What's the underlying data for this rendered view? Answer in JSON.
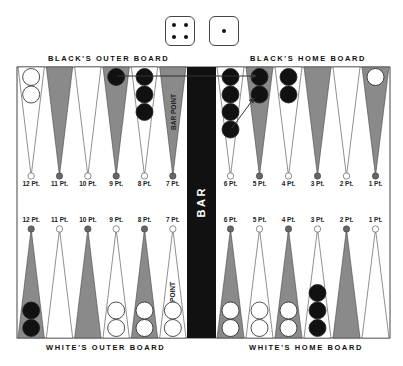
{
  "dice": [
    {
      "name": "die-four",
      "value": 4
    },
    {
      "name": "die-one",
      "value": 1
    }
  ],
  "labels": {
    "black_outer": "BLACK'S OUTER BOARD",
    "black_home": "BLACK'S HOME BOARD",
    "white_outer": "WHITE'S OUTER BOARD",
    "white_home": "WHITE'S HOME BOARD",
    "bar": "B A R",
    "bar_point_top": "BAR POINT",
    "bar_point_bottom": "POINT"
  },
  "top_points": [
    {
      "label": "12 Pt.",
      "shade": "white",
      "checkers": {
        "color": "white",
        "count": 2
      }
    },
    {
      "label": "11 Pt.",
      "shade": "dark",
      "checkers": {
        "color": "none",
        "count": 0
      }
    },
    {
      "label": "10 Pt.",
      "shade": "white",
      "checkers": {
        "color": "none",
        "count": 0
      }
    },
    {
      "label": "9 Pt.",
      "shade": "dark",
      "checkers": {
        "color": "black",
        "count": 1
      }
    },
    {
      "label": "8 Pt.",
      "shade": "white",
      "checkers": {
        "color": "black",
        "count": 3
      }
    },
    {
      "label": "7 Pt.",
      "shade": "dark",
      "checkers": {
        "color": "none",
        "count": 0
      }
    },
    {
      "label": "6 Pt.",
      "shade": "white",
      "checkers": {
        "color": "black",
        "count": 4
      }
    },
    {
      "label": "5 Pt.",
      "shade": "dark",
      "checkers": {
        "color": "black",
        "count": 2
      }
    },
    {
      "label": "4 Pt.",
      "shade": "white",
      "checkers": {
        "color": "black",
        "count": 2
      }
    },
    {
      "label": "3 Pt.",
      "shade": "dark",
      "checkers": {
        "color": "none",
        "count": 0
      }
    },
    {
      "label": "2 Pt.",
      "shade": "white",
      "checkers": {
        "color": "none",
        "count": 0
      }
    },
    {
      "label": "1 Pt.",
      "shade": "dark",
      "checkers": {
        "color": "white",
        "count": 1
      }
    }
  ],
  "bottom_points": [
    {
      "label": "12 Pt.",
      "shade": "dark",
      "checkers": {
        "color": "black",
        "count": 2
      }
    },
    {
      "label": "11 Pt.",
      "shade": "white",
      "checkers": {
        "color": "none",
        "count": 0
      }
    },
    {
      "label": "10 Pt.",
      "shade": "dark",
      "checkers": {
        "color": "none",
        "count": 0
      }
    },
    {
      "label": "9 Pt.",
      "shade": "white",
      "checkers": {
        "color": "white",
        "count": 2
      }
    },
    {
      "label": "8 Pt.",
      "shade": "dark",
      "checkers": {
        "color": "white",
        "count": 2
      }
    },
    {
      "label": "7 Pt.",
      "shade": "white",
      "checkers": {
        "color": "white",
        "count": 2
      }
    },
    {
      "label": "6 Pt.",
      "shade": "dark",
      "checkers": {
        "color": "white",
        "count": 2
      }
    },
    {
      "label": "5 Pt.",
      "shade": "white",
      "checkers": {
        "color": "white",
        "count": 2
      }
    },
    {
      "label": "4 Pt.",
      "shade": "dark",
      "checkers": {
        "color": "white",
        "count": 2
      }
    },
    {
      "label": "3 Pt.",
      "shade": "white",
      "checkers": {
        "color": "black",
        "count": 3
      }
    },
    {
      "label": "2 Pt.",
      "shade": "dark",
      "checkers": {
        "color": "none",
        "count": 0
      }
    },
    {
      "label": "1 Pt.",
      "shade": "white",
      "checkers": {
        "color": "none",
        "count": 0
      }
    }
  ],
  "moves": [
    {
      "from": "9 Pt.",
      "to": "5 Pt.",
      "die": 4
    },
    {
      "from": "6 Pt.",
      "to": "5 Pt.",
      "die": 1
    }
  ],
  "colors": {
    "board_bg": "#ffffff",
    "dark_point": "#8a8a8a",
    "bar": "#111111",
    "black_checker": "#111111",
    "white_checker": "#ffffff",
    "outline": "#333333"
  }
}
